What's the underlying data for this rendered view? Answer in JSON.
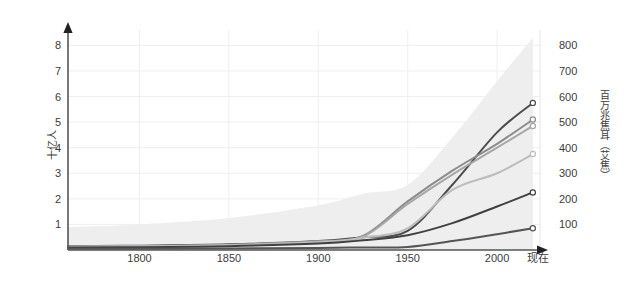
{
  "chart_data": {
    "type": "line",
    "title": "",
    "subtitle": "",
    "xlabel": "",
    "ylabel": "十亿人",
    "y2label": "百万兆焦耳（艾焦）",
    "xlim": [
      1760,
      2024
    ],
    "ylim": [
      0,
      8.6
    ],
    "y2lim": [
      0,
      860
    ],
    "grid": true,
    "legend": "none",
    "x_ticks": [
      1800,
      1850,
      1900,
      1950,
      2000
    ],
    "x_tick_labels": [
      "1800",
      "1850",
      "1900",
      "1950",
      "2000"
    ],
    "x_end_label": "现在",
    "y_ticks": [
      1,
      2,
      3,
      4,
      5,
      6,
      7,
      8
    ],
    "y_tick_labels": [
      "1",
      "2",
      "3",
      "4",
      "5",
      "6",
      "7",
      "8"
    ],
    "y2_ticks": [
      100,
      200,
      300,
      400,
      500,
      600,
      700,
      800
    ],
    "y2_tick_labels": [
      "100",
      "200",
      "300",
      "400",
      "500",
      "600",
      "700",
      "800"
    ],
    "x": [
      1760,
      1800,
      1850,
      1900,
      1925,
      1950,
      1975,
      2000,
      2020
    ],
    "band": {
      "name": "不确定性范围",
      "color": "#eeeeee",
      "lower": [
        0.0,
        0.0,
        0.0,
        0.0,
        0.0,
        0.0,
        0.0,
        0.0,
        0.0
      ],
      "upper": [
        0.9,
        1.0,
        1.25,
        1.75,
        2.2,
        2.55,
        4.4,
        6.6,
        8.3
      ]
    },
    "series": [
      {
        "name": "系列1",
        "color": "#4d4d4d",
        "width": 2.0,
        "values": [
          0.15,
          0.17,
          0.22,
          0.35,
          0.5,
          0.75,
          2.55,
          4.6,
          5.75
        ],
        "marker": "circle-open",
        "end_value": 5.75
      },
      {
        "name": "系列2",
        "color": "#8c8c8c",
        "width": 2.0,
        "values": [
          0.14,
          0.16,
          0.21,
          0.34,
          0.55,
          1.9,
          3.1,
          4.15,
          5.1
        ],
        "marker": "circle-open",
        "end_value": 5.1
      },
      {
        "name": "系列3",
        "color": "#a6a6a6",
        "width": 2.0,
        "values": [
          0.13,
          0.15,
          0.2,
          0.33,
          0.52,
          1.8,
          2.95,
          4.0,
          4.85
        ],
        "marker": "circle-open",
        "end_value": 4.85
      },
      {
        "name": "系列4",
        "color": "#bdbdbd",
        "width": 2.0,
        "values": [
          0.12,
          0.14,
          0.19,
          0.3,
          0.48,
          0.85,
          2.35,
          3.0,
          3.75
        ],
        "marker": "circle-open",
        "end_value": 3.75
      },
      {
        "name": "系列5",
        "color": "#404040",
        "width": 2.0,
        "values": [
          0.1,
          0.11,
          0.15,
          0.25,
          0.38,
          0.58,
          1.05,
          1.7,
          2.25
        ],
        "marker": "circle-open",
        "end_value": 2.25
      },
      {
        "name": "系列6",
        "color": "#555555",
        "width": 2.0,
        "values": [
          0.05,
          0.05,
          0.06,
          0.08,
          0.1,
          0.12,
          0.35,
          0.62,
          0.85
        ],
        "marker": "circle-open",
        "end_value": 0.85
      }
    ]
  },
  "colors": {
    "background": "#ffffff",
    "axis": "#555555",
    "grid": "#efefef",
    "text": "#3c3c3c",
    "band": "#eeeeee"
  }
}
